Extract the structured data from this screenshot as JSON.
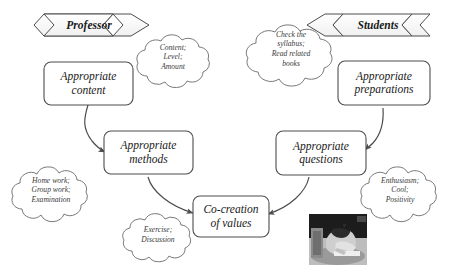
{
  "diagram": {
    "stroke_color": "#4d4d4d",
    "text_color": "#1a1a1a",
    "background": "#ffffff",
    "banners": [
      {
        "id": "professor",
        "label": "Professor",
        "direction": "right"
      },
      {
        "id": "students",
        "label": "Students",
        "direction": "left"
      }
    ],
    "boxes": [
      {
        "id": "appropriate-content",
        "label": "Appropriate\ncontent"
      },
      {
        "id": "appropriate-methods",
        "label": "Appropriate\nmethods"
      },
      {
        "id": "appropriate-preparations",
        "label": "Appropriate\npreparations"
      },
      {
        "id": "appropriate-questions",
        "label": "Appropriate\nquestions"
      },
      {
        "id": "co-creation-of-values",
        "label": "Co-creation\nof values"
      }
    ],
    "clouds": [
      {
        "id": "content-cloud",
        "label": "Content;\nLevel;\nAmount"
      },
      {
        "id": "syllabus-cloud",
        "label": "Check the\nsyllabus;\nRead related\nbooks"
      },
      {
        "id": "homework-cloud",
        "label": "Home work;\nGroup work;\nExamination"
      },
      {
        "id": "exercise-cloud",
        "label": "Exercise;\nDiscussion"
      },
      {
        "id": "enthusiasm-cloud",
        "label": "Enthusiasm;\nCool;\nPositivity"
      }
    ],
    "photo": {
      "id": "student-studying-photo",
      "alt": "student studying at a desk"
    }
  }
}
